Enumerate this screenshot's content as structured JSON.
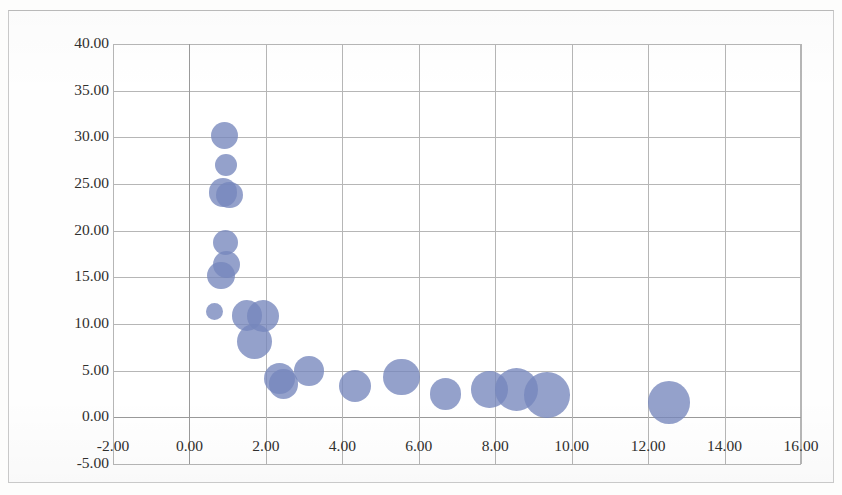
{
  "chart": {
    "type": "bubble",
    "title": "",
    "subtitle": "",
    "xlabel": "",
    "ylabel": "",
    "series_name": "Series 1",
    "bubble_color": "#7687bd",
    "gridline_color": "#b6b6b6",
    "plot_background": "#ffffff",
    "frame_color": "#c9c9c9"
  },
  "chart_data": {
    "type": "scatter",
    "title": "",
    "subtitle": "",
    "xlabel": "",
    "ylabel": "",
    "xlim": [
      -2.0,
      16.0
    ],
    "ylim": [
      -5.0,
      40.0
    ],
    "xticks": [
      "-2.00",
      "0.00",
      "2.00",
      "4.00",
      "6.00",
      "8.00",
      "10.00",
      "12.00",
      "14.00",
      "16.00"
    ],
    "xtick_values": [
      -2.0,
      0.0,
      2.0,
      4.0,
      6.0,
      8.0,
      10.0,
      12.0,
      14.0,
      16.0
    ],
    "yticks": [
      "-5.00",
      "0.00",
      "5.00",
      "10.00",
      "15.00",
      "20.00",
      "25.00",
      "30.00",
      "35.00",
      "40.00"
    ],
    "ytick_values": [
      -5.0,
      0.0,
      5.0,
      10.0,
      15.0,
      20.0,
      25.0,
      30.0,
      35.0,
      40.0
    ],
    "grid": true,
    "legend": "none",
    "series": [
      {
        "name": "Series 1",
        "points": [
          {
            "x": 0.92,
            "y": 30.2,
            "size": 2.0
          },
          {
            "x": 0.95,
            "y": 27.0,
            "size": 1.3
          },
          {
            "x": 0.88,
            "y": 24.1,
            "size": 2.2
          },
          {
            "x": 1.05,
            "y": 23.8,
            "size": 1.9
          },
          {
            "x": 0.95,
            "y": 18.7,
            "size": 1.7
          },
          {
            "x": 0.98,
            "y": 16.4,
            "size": 2.0
          },
          {
            "x": 0.82,
            "y": 15.2,
            "size": 2.1
          },
          {
            "x": 0.66,
            "y": 11.3,
            "size": 0.8
          },
          {
            "x": 1.5,
            "y": 10.9,
            "size": 2.5
          },
          {
            "x": 1.92,
            "y": 10.9,
            "size": 2.8
          },
          {
            "x": 1.7,
            "y": 8.1,
            "size": 3.4
          },
          {
            "x": 2.35,
            "y": 4.2,
            "size": 2.6
          },
          {
            "x": 2.46,
            "y": 3.6,
            "size": 2.4
          },
          {
            "x": 3.12,
            "y": 5.0,
            "size": 2.4
          },
          {
            "x": 4.32,
            "y": 3.4,
            "size": 2.8
          },
          {
            "x": 5.55,
            "y": 4.3,
            "size": 3.6
          },
          {
            "x": 6.7,
            "y": 2.5,
            "size": 2.7
          },
          {
            "x": 7.85,
            "y": 3.0,
            "size": 3.6
          },
          {
            "x": 8.55,
            "y": 3.0,
            "size": 5.0
          },
          {
            "x": 9.35,
            "y": 2.4,
            "size": 5.6
          },
          {
            "x": 12.55,
            "y": 1.6,
            "size": 4.9
          }
        ]
      }
    ]
  }
}
